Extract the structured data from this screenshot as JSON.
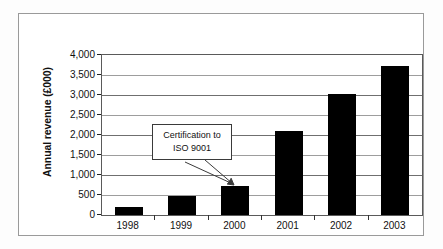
{
  "chart_data": {
    "type": "bar",
    "title": "",
    "subtitle": "",
    "xlabel": "",
    "ylabel": "Annual revenue (£000)",
    "categories": [
      "1998",
      "1999",
      "2000",
      "2001",
      "2002",
      "2003"
    ],
    "values": [
      200,
      475,
      725,
      2100,
      3030,
      3720
    ],
    "series": [
      {
        "name": "Annual revenue",
        "values": [
          200,
          475,
          725,
          2100,
          3030,
          3720
        ],
        "color": "#000000"
      }
    ],
    "ylim": [
      0,
      4000
    ],
    "ytick_values": [
      0,
      500,
      1000,
      1500,
      2000,
      2500,
      3000,
      3500,
      4000
    ],
    "ytick_labels": [
      "0",
      "500",
      "1,000",
      "1,500",
      "2,000",
      "2,500",
      "3,000",
      "3,500",
      "4,000"
    ],
    "grid": true,
    "grid_axis": "y",
    "legend": false,
    "legend_position": "none",
    "annotations": [
      {
        "name": "iso-certification-callout",
        "lines": [
          "Certification to",
          "ISO 9001"
        ],
        "points_to_category": "2000",
        "arrow": true
      }
    ]
  },
  "figure": {
    "bar_color": "#000000",
    "frame_color": "#9a9a9a",
    "axis_color": "#5a5a5a",
    "gridline_color": "#6f6f6f",
    "background": "#ffffff"
  }
}
